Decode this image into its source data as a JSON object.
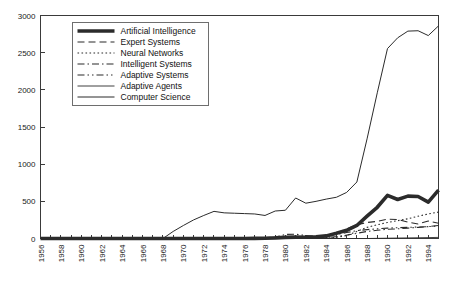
{
  "chart_data": {
    "type": "line",
    "title": "",
    "subtitle": "",
    "xlabel": "",
    "ylabel": "",
    "xlim": [
      1956,
      1995
    ],
    "ylim": [
      0,
      3000
    ],
    "yticks": [
      0,
      500,
      1000,
      1500,
      2000,
      2500,
      3000
    ],
    "ytick_labels": [
      "0",
      "500",
      "1000",
      "1500",
      "2000",
      "2500",
      "3000"
    ],
    "grid": false,
    "legend_position": "upper-left-inside",
    "x": [
      1956,
      1957,
      1958,
      1959,
      1960,
      1961,
      1962,
      1963,
      1964,
      1965,
      1966,
      1967,
      1968,
      1969,
      1970,
      1971,
      1972,
      1973,
      1974,
      1975,
      1976,
      1977,
      1978,
      1979,
      1980,
      1981,
      1982,
      1983,
      1984,
      1985,
      1986,
      1987,
      1988,
      1989,
      1990,
      1991,
      1992,
      1993,
      1994,
      1995
    ],
    "xtick_labels": [
      "1956",
      "1958",
      "1960",
      "1962",
      "1964",
      "1966",
      "1968",
      "1970",
      "1972",
      "1974",
      "1976",
      "1978",
      "1980",
      "1982",
      "1984",
      "1986",
      "1988",
      "1990",
      "1992",
      "1994"
    ],
    "xtick_values": [
      1956,
      1958,
      1960,
      1962,
      1964,
      1966,
      1968,
      1970,
      1972,
      1974,
      1976,
      1978,
      1980,
      1982,
      1984,
      1986,
      1988,
      1990,
      1992,
      1994
    ],
    "series": [
      {
        "name": "Artificial Intelligence",
        "style": "thick-solid",
        "stroke_width": 3.6,
        "dash": "none",
        "values": [
          0,
          0,
          0,
          0,
          0,
          0,
          0,
          0,
          0,
          0,
          0,
          0,
          0,
          0,
          0,
          0,
          0,
          0,
          0,
          0,
          0,
          2,
          4,
          8,
          15,
          18,
          16,
          22,
          35,
          70,
          110,
          175,
          300,
          420,
          580,
          525,
          570,
          565,
          490,
          650
        ]
      },
      {
        "name": "Expert Systems",
        "style": "dashed",
        "stroke_width": 1.1,
        "dash": "7,4",
        "values": [
          0,
          0,
          0,
          0,
          0,
          0,
          0,
          0,
          0,
          0,
          0,
          0,
          0,
          0,
          0,
          0,
          0,
          0,
          0,
          0,
          0,
          0,
          0,
          2,
          8,
          12,
          10,
          14,
          30,
          75,
          130,
          185,
          215,
          230,
          260,
          255,
          220,
          195,
          235,
          205
        ]
      },
      {
        "name": "Neural Networks",
        "style": "dotted",
        "stroke_width": 1.1,
        "dash": "1.6,2.4",
        "values": [
          0,
          0,
          0,
          0,
          0,
          0,
          0,
          0,
          0,
          0,
          0,
          0,
          0,
          0,
          0,
          0,
          0,
          0,
          0,
          0,
          0,
          0,
          0,
          0,
          2,
          3,
          3,
          4,
          8,
          16,
          40,
          95,
          150,
          185,
          215,
          240,
          265,
          300,
          330,
          355
        ]
      },
      {
        "name": "Intelligent Systems",
        "style": "dash-dot",
        "stroke_width": 1.1,
        "dash": "7,3,1.5,3",
        "values": [
          0,
          0,
          0,
          0,
          0,
          0,
          0,
          0,
          0,
          0,
          0,
          0,
          0,
          0,
          0,
          0,
          0,
          0,
          0,
          0,
          0,
          0,
          0,
          2,
          4,
          6,
          5,
          7,
          12,
          25,
          45,
          70,
          95,
          110,
          125,
          130,
          140,
          150,
          160,
          175
        ]
      },
      {
        "name": "Adaptive Systems",
        "style": "dash-dot-dot",
        "stroke_width": 1.1,
        "dash": "7,3,1.5,3,1.5,3",
        "values": [
          0,
          0,
          0,
          0,
          0,
          0,
          0,
          0,
          0,
          0,
          0,
          0,
          0,
          0,
          0,
          0,
          0,
          0,
          0,
          0,
          0,
          0,
          0,
          18,
          55,
          58,
          40,
          30,
          32,
          55,
          80,
          105,
          120,
          130,
          140,
          145,
          150,
          155,
          160,
          170
        ]
      },
      {
        "name": "Adaptive Agents",
        "style": "thin-solid",
        "stroke_width": 0.9,
        "dash": "none",
        "values": [
          0,
          0,
          0,
          0,
          0,
          0,
          0,
          0,
          0,
          0,
          0,
          0,
          0,
          0,
          0,
          0,
          0,
          0,
          0,
          0,
          0,
          0,
          0,
          0,
          0,
          0,
          0,
          0,
          0,
          0,
          0,
          0,
          0,
          2,
          4,
          6,
          8,
          10,
          12,
          15
        ]
      },
      {
        "name": "Computer Science",
        "style": "thin-solid",
        "stroke_width": 1.0,
        "dash": "none",
        "values": [
          0,
          0,
          0,
          0,
          0,
          0,
          0,
          0,
          0,
          0,
          0,
          0,
          0,
          95,
          175,
          250,
          310,
          365,
          345,
          340,
          335,
          330,
          310,
          370,
          380,
          545,
          475,
          500,
          530,
          555,
          620,
          760,
          1340,
          1960,
          2555,
          2700,
          2790,
          2795,
          2730,
          2860
        ]
      }
    ]
  },
  "legend": {
    "entries": [
      "Artificial Intelligence",
      "Expert Systems",
      "Neural Networks",
      "Intelligent Systems",
      "Adaptive Systems",
      "Adaptive Agents",
      "Computer Science"
    ]
  }
}
